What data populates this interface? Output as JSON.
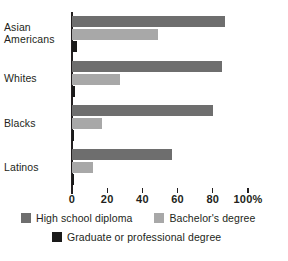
{
  "chart_data": {
    "type": "bar",
    "orientation": "horizontal",
    "title": "",
    "xlabel": "",
    "ylabel": "",
    "xlim": [
      0,
      100
    ],
    "xticks": [
      0,
      20,
      40,
      60,
      80,
      100
    ],
    "xtick_labels": [
      "0",
      "20",
      "40",
      "60",
      "80",
      "100%"
    ],
    "grid": false,
    "legend_position": "bottom",
    "categories": [
      "Asian\nAmericans",
      "Whites",
      "Blacks",
      "Latinos"
    ],
    "series": [
      {
        "name": "High school diploma",
        "color": "#6e6e6e",
        "values": [
          87,
          85,
          80,
          57
        ]
      },
      {
        "name": "Bachelor's degree",
        "color": "#a8a8a8",
        "values": [
          49,
          27,
          17,
          12
        ]
      },
      {
        "name": "Graduate or professional degree",
        "color": "#1a1a1a",
        "values": [
          3,
          1.5,
          1,
          1
        ]
      }
    ]
  },
  "axis": {
    "tick_labels": [
      "0",
      "20",
      "40",
      "60",
      "80",
      "100%"
    ]
  },
  "categories": [
    {
      "label": "Asian\nAmericans"
    },
    {
      "label": "Whites"
    },
    {
      "label": "Blacks"
    },
    {
      "label": "Latinos"
    }
  ],
  "legend": {
    "items": [
      {
        "label": "High school diploma",
        "color": "#6e6e6e"
      },
      {
        "label": "Bachelor's degree",
        "color": "#a8a8a8"
      },
      {
        "label": "Graduate or professional degree",
        "color": "#1a1a1a"
      }
    ]
  }
}
